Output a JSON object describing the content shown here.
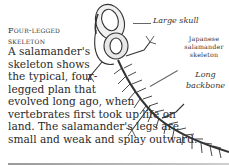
{
  "heading": {
    "line1": "Four-legged",
    "line2": "skeleton"
  },
  "body": {
    "lines": [
      "A salamander's",
      "skeleton shows",
      "the typical, four-",
      "legged plan that",
      "evolved long ago, when",
      "vertebrates first took up life on",
      "land. The salamander's legs are",
      "small and weak and splay outward."
    ]
  },
  "illustration": {
    "subject": "salamander-skeleton",
    "labels": {
      "skull": "Large skull",
      "title_line1": "Japanese",
      "title_line2": "salamander",
      "title_line3": "skeleton",
      "backbone_line1": "Long",
      "backbone_line2": "backbone"
    }
  }
}
